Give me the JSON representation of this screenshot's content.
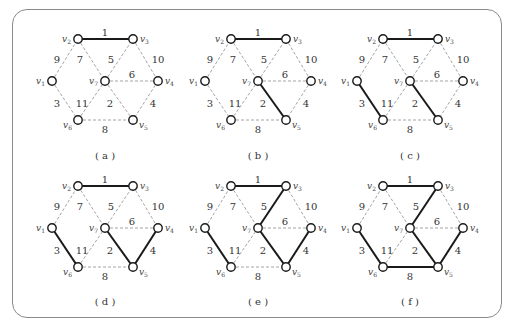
{
  "figure": {
    "vertices": [
      {
        "id": "v1",
        "label": "v",
        "sub": "1",
        "x": 0,
        "y": 42,
        "label_side": "left"
      },
      {
        "id": "v2",
        "label": "v",
        "sub": "2",
        "x": 26,
        "y": 0,
        "label_side": "left"
      },
      {
        "id": "v3",
        "label": "v",
        "sub": "3",
        "x": 81,
        "y": 0,
        "label_side": "right"
      },
      {
        "id": "v4",
        "label": "v",
        "sub": "4",
        "x": 106,
        "y": 42,
        "label_side": "right"
      },
      {
        "id": "v5",
        "label": "v",
        "sub": "5",
        "x": 81,
        "y": 81,
        "label_side": "right-below"
      },
      {
        "id": "v6",
        "label": "v",
        "sub": "6",
        "x": 26,
        "y": 81,
        "label_side": "left-below"
      },
      {
        "id": "v7",
        "label": "v",
        "sub": "7",
        "x": 53,
        "y": 42,
        "label_side": "left"
      }
    ],
    "edges": [
      {
        "id": "e1",
        "from": "v2",
        "to": "v3",
        "weight": "1",
        "lx": 53,
        "ly": -7
      },
      {
        "id": "e2",
        "from": "v7",
        "to": "v5",
        "weight": "2",
        "lx": 58,
        "ly": 64
      },
      {
        "id": "e3",
        "from": "v1",
        "to": "v6",
        "weight": "3",
        "lx": 5,
        "ly": 64
      },
      {
        "id": "e4",
        "from": "v4",
        "to": "v5",
        "weight": "4",
        "lx": 101,
        "ly": 64
      },
      {
        "id": "e5",
        "from": "v7",
        "to": "v3",
        "weight": "5",
        "lx": 59,
        "ly": 20
      },
      {
        "id": "e6",
        "from": "v7",
        "to": "v4",
        "weight": "6",
        "lx": 80,
        "ly": 35
      },
      {
        "id": "e7",
        "from": "v2",
        "to": "v7",
        "weight": "7",
        "lx": 28,
        "ly": 20
      },
      {
        "id": "e8",
        "from": "v6",
        "to": "v5",
        "weight": "8",
        "lx": 53,
        "ly": 90
      },
      {
        "id": "e9",
        "from": "v1",
        "to": "v2",
        "weight": "9",
        "lx": 5,
        "ly": 20
      },
      {
        "id": "e10",
        "from": "v3",
        "to": "v4",
        "weight": "10",
        "lx": 106,
        "ly": 20
      },
      {
        "id": "e11",
        "from": "v6",
        "to": "v7",
        "weight": "11",
        "lx": 30,
        "ly": 64
      }
    ],
    "panels": [
      {
        "id": "a",
        "caption": "( a )",
        "ox": 52,
        "oy": 39,
        "cy": 155,
        "selected": [
          "e1"
        ]
      },
      {
        "id": "b",
        "caption": "( b )",
        "ox": 205,
        "oy": 39,
        "cy": 155,
        "selected": [
          "e1",
          "e2"
        ]
      },
      {
        "id": "c",
        "caption": "( c )",
        "ox": 357,
        "oy": 39,
        "cy": 155,
        "selected": [
          "e1",
          "e2",
          "e3"
        ]
      },
      {
        "id": "d",
        "caption": "( d )",
        "ox": 52,
        "oy": 186,
        "cy": 301,
        "selected": [
          "e1",
          "e2",
          "e3",
          "e4"
        ]
      },
      {
        "id": "e",
        "caption": "( e )",
        "ox": 205,
        "oy": 186,
        "cy": 301,
        "selected": [
          "e1",
          "e2",
          "e3",
          "e4",
          "e5"
        ]
      },
      {
        "id": "f",
        "caption": "( f )",
        "ox": 357,
        "oy": 186,
        "cy": 301,
        "selected": [
          "e1",
          "e2",
          "e3",
          "e4",
          "e5",
          "e8"
        ]
      }
    ]
  },
  "style": {
    "selected_edge_color": "#1a1a1a",
    "unselected_edge_color": "#9a9a9a",
    "node_stroke": "#1a1a1a",
    "frame_color": "#8a8a8a"
  }
}
